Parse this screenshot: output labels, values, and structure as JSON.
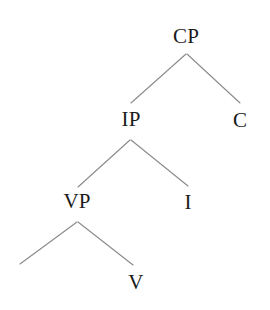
{
  "diagram": {
    "kind": "syntax-tree",
    "title": "",
    "background_color": "#ffffff",
    "line_color": "#8a8a8a",
    "text_color": "#1a1a1a",
    "nodes": [
      {
        "id": "cp",
        "label": "CP",
        "x": 186,
        "y": 36
      },
      {
        "id": "ip",
        "label": "IP",
        "x": 131,
        "y": 119
      },
      {
        "id": "c",
        "label": "C",
        "x": 240,
        "y": 120
      },
      {
        "id": "vp",
        "label": "VP",
        "x": 77,
        "y": 201
      },
      {
        "id": "i",
        "label": "I",
        "x": 188,
        "y": 202
      },
      {
        "id": "v",
        "label": "V",
        "x": 136,
        "y": 282
      },
      {
        "id": "spec-vp",
        "label": "",
        "x": 20,
        "y": 280
      }
    ],
    "edges": [
      {
        "from": "cp",
        "to": "ip",
        "x1": 186,
        "y1": 54,
        "x2": 131,
        "y2": 103
      },
      {
        "from": "cp",
        "to": "c",
        "x1": 187,
        "y1": 54,
        "x2": 240,
        "y2": 103
      },
      {
        "from": "ip",
        "to": "vp",
        "x1": 130,
        "y1": 140,
        "x2": 78,
        "y2": 187
      },
      {
        "from": "ip",
        "to": "i",
        "x1": 131,
        "y1": 140,
        "x2": 188,
        "y2": 186
      },
      {
        "from": "vp",
        "to": "spec-vp",
        "x1": 77,
        "y1": 222,
        "x2": 20,
        "y2": 264
      },
      {
        "from": "vp",
        "to": "v",
        "x1": 78,
        "y1": 222,
        "x2": 133,
        "y2": 265
      }
    ]
  }
}
